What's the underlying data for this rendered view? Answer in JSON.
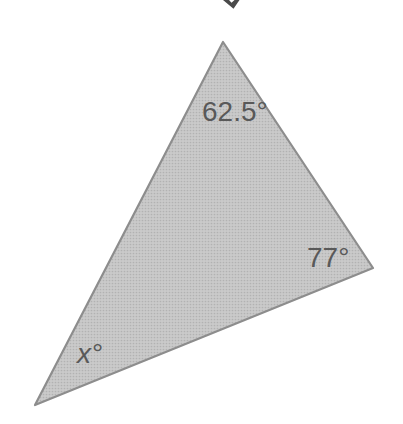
{
  "figure": {
    "type": "triangle-angle-diagram",
    "angles": {
      "top": {
        "label": "62.5°"
      },
      "right": {
        "label": "77°"
      },
      "bottom_left": {
        "label": "x°"
      }
    },
    "colors": {
      "background": "#ffffff",
      "triangle_fill": "#cacaca",
      "triangle_halftone_dot": "#b2b2b2",
      "triangle_stroke": "#8d8d8d",
      "label_text": "#595959",
      "top_artifact": "#4a4a4a"
    }
  }
}
